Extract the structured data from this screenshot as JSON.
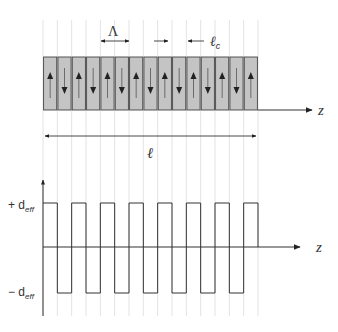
{
  "diagram": {
    "colors": {
      "domain_fill": "#c4c4c4",
      "domain_stroke": "#444444",
      "guide_line": "#dcdcdc",
      "axis": "#333333"
    },
    "labels": {
      "period": "Λ",
      "coherence_length": "ℓ",
      "coherence_length_sub": "c",
      "crystal_length": "ℓ",
      "z_axis_top": "z",
      "z_axis_bottom": "z",
      "plus_d_prefix": "+ d",
      "plus_d_sub": "eff",
      "minus_d_prefix": "− d",
      "minus_d_sub": "eff"
    },
    "domains": {
      "count": 15,
      "orientations": [
        "up",
        "down",
        "up",
        "down",
        "up",
        "down",
        "up",
        "down",
        "up",
        "down",
        "up",
        "down",
        "up",
        "down",
        "up"
      ]
    },
    "square_wave": {
      "levels": [
        "+d_eff",
        "-d_eff"
      ],
      "half_periods": 15
    }
  }
}
